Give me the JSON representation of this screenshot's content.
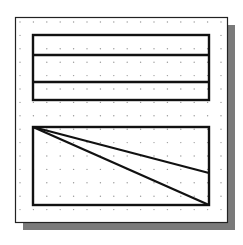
{
  "diagram": {
    "type": "cad-sketch-drawing-area",
    "colors": {
      "background": "#ffffff",
      "frame_stroke": "#222222",
      "shadow": "#7a7a7a",
      "grid_dot": "#9a9a9a",
      "shape_stroke": "#111111"
    },
    "frame": {
      "x": 15,
      "y": 17,
      "width": 212,
      "height": 205,
      "shadow_offset": 8
    },
    "grid": {
      "origin_x": 20,
      "origin_y": 22,
      "spacing": 13.4,
      "cols": 16,
      "rows": 15
    },
    "top_rectangle": {
      "x": 33,
      "y": 35,
      "width": 176,
      "height": 65,
      "divider_lines_y": [
        55,
        82
      ]
    },
    "bottom_rectangle": {
      "x": 33,
      "y": 127,
      "width": 176,
      "height": 78,
      "diagonals": [
        {
          "from": [
            33,
            127
          ],
          "to": [
            209,
            173
          ]
        },
        {
          "from": [
            33,
            127
          ],
          "to": [
            209,
            205
          ]
        }
      ]
    }
  }
}
